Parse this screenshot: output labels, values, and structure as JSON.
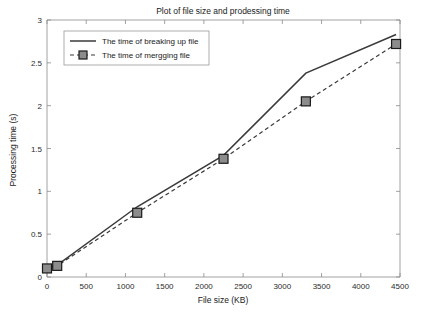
{
  "chart_data": {
    "type": "line",
    "title": "Plot of file size and prodessing time",
    "xlabel": "File size (KB)",
    "ylabel": "Processing time (s)",
    "xlim": [
      0,
      4500
    ],
    "ylim": [
      0,
      3
    ],
    "xticks": [
      0,
      500,
      1000,
      1500,
      2000,
      2500,
      3000,
      3500,
      4000,
      4500
    ],
    "xtick_labels": [
      "0",
      "500",
      "1000",
      "1500",
      "2000",
      "2500",
      "3000",
      "3500",
      "4000",
      "4500"
    ],
    "yticks": [
      0,
      0.5,
      1,
      1.5,
      2,
      2.5,
      3
    ],
    "ytick_labels": [
      "0",
      "0.5",
      "1",
      "1.5",
      "2",
      "2.5",
      "3"
    ],
    "grid": false,
    "legend_position": "upper left",
    "series": [
      {
        "name": "The time of breaking up file",
        "style": "solid",
        "marker": "none",
        "color": "#3a3a3a",
        "x": [
          0,
          130,
          1150,
          2250,
          3300,
          4450
        ],
        "values": [
          0.1,
          0.14,
          0.82,
          1.42,
          2.38,
          2.83
        ]
      },
      {
        "name": "The time of mergging file",
        "style": "dashed",
        "marker": "square",
        "color": "#3a3a3a",
        "x": [
          0,
          130,
          1150,
          2250,
          3300,
          4450
        ],
        "values": [
          0.1,
          0.13,
          0.75,
          1.38,
          2.05,
          2.72
        ]
      }
    ]
  },
  "legend": {
    "items": [
      {
        "label": "The time of breaking up file"
      },
      {
        "label": "The time of mergging file"
      }
    ]
  }
}
